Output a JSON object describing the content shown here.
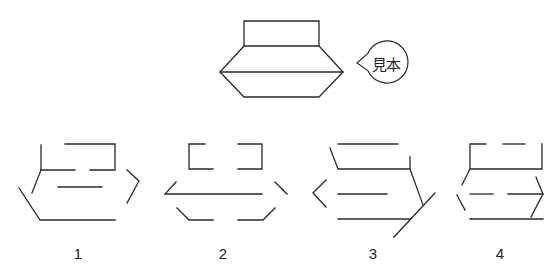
{
  "sample": {
    "bubble_label": "見本",
    "bubble": {
      "cx": 387,
      "cy": 62,
      "r": 21,
      "tip": [
        357,
        63
      ]
    },
    "segments": [
      [
        [
          244,
          21
        ],
        [
          319,
          21
        ],
        [
          319,
          46
        ],
        [
          244,
          46
        ],
        [
          244,
          21
        ]
      ],
      [
        [
          244,
          46
        ],
        [
          220,
          72
        ],
        [
          244,
          97
        ],
        [
          319,
          97
        ],
        [
          343,
          72
        ],
        [
          319,
          46
        ]
      ],
      [
        [
          220,
          72
        ],
        [
          343,
          72
        ]
      ]
    ]
  },
  "options": [
    {
      "label": "1",
      "label_pos": [
        78,
        253
      ],
      "segments": [
        [
          [
            41,
            145
          ],
          [
            41,
            170
          ]
        ],
        [
          [
            65,
            144
          ],
          [
            115,
            144
          ],
          [
            115,
            170
          ],
          [
            90,
            170
          ]
        ],
        [
          [
            41,
            170
          ],
          [
            75,
            170
          ]
        ],
        [
          [
            41,
            170
          ],
          [
            32,
            193
          ]
        ],
        [
          [
            58,
            187
          ],
          [
            102,
            187
          ]
        ],
        [
          [
            127,
            170
          ],
          [
            139,
            181
          ],
          [
            127,
            203
          ]
        ],
        [
          [
            19,
            188
          ],
          [
            40,
            220
          ],
          [
            115,
            220
          ]
        ]
      ]
    },
    {
      "label": "2",
      "label_pos": [
        223,
        253
      ],
      "segments": [
        [
          [
            205,
            144
          ],
          [
            189,
            144
          ],
          [
            189,
            169
          ],
          [
            213,
            169
          ]
        ],
        [
          [
            238,
            144
          ],
          [
            262,
            144
          ],
          [
            262,
            169
          ],
          [
            238,
            169
          ]
        ],
        [
          [
            176,
            182
          ],
          [
            165,
            194
          ],
          [
            262,
            194
          ]
        ],
        [
          [
            275,
            182
          ],
          [
            287,
            194
          ]
        ],
        [
          [
            177,
            208
          ],
          [
            189,
            220
          ],
          [
            213,
            220
          ]
        ],
        [
          [
            238,
            220
          ],
          [
            263,
            220
          ],
          [
            275,
            208
          ]
        ]
      ]
    },
    {
      "label": "3",
      "label_pos": [
        373,
        253
      ],
      "segments": [
        [
          [
            338,
            144
          ],
          [
            398,
            144
          ]
        ],
        [
          [
            330,
            148
          ],
          [
            338,
            169
          ],
          [
            410,
            169
          ]
        ],
        [
          [
            410,
            157
          ],
          [
            410,
            169
          ],
          [
            423,
            205
          ]
        ],
        [
          [
            326,
            180
          ],
          [
            313,
            193
          ],
          [
            326,
            207
          ]
        ],
        [
          [
            338,
            194
          ],
          [
            387,
            194
          ]
        ],
        [
          [
            338,
            219
          ],
          [
            410,
            219
          ]
        ],
        [
          [
            435,
            193
          ],
          [
            394,
            237
          ]
        ]
      ]
    },
    {
      "label": "4",
      "label_pos": [
        500,
        253
      ],
      "segments": [
        [
          [
            486,
            144
          ],
          [
            470,
            144
          ],
          [
            470,
            169
          ],
          [
            542,
            169
          ],
          [
            542,
            144
          ]
        ],
        [
          [
            503,
            144
          ],
          [
            525,
            144
          ]
        ],
        [
          [
            470,
            169
          ],
          [
            462,
            185
          ]
        ],
        [
          [
            457,
            195
          ],
          [
            465,
            210
          ]
        ],
        [
          [
            470,
            194
          ],
          [
            493,
            194
          ]
        ],
        [
          [
            508,
            194
          ],
          [
            543,
            194
          ]
        ],
        [
          [
            536,
            177
          ],
          [
            543,
            194
          ],
          [
            531,
            217
          ]
        ],
        [
          [
            470,
            219
          ],
          [
            543,
            219
          ]
        ]
      ]
    }
  ],
  "colors": {
    "stroke": "#2a2a2a",
    "background": "#ffffff"
  }
}
